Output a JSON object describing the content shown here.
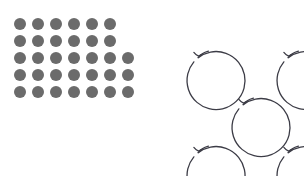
{
  "figure": {
    "background_color": "#ffffff",
    "width": 304,
    "height": 176
  },
  "dot_grid": {
    "label": "gray dot grid",
    "dot_color": "#6b6b6b",
    "dot_diameter": 12,
    "dot_gap": 6,
    "origin_x": 14,
    "origin_y": 18,
    "row_count": 5,
    "total_dots": 33,
    "rows": [
      {
        "index": 1,
        "count": 6
      },
      {
        "index": 2,
        "count": 6
      },
      {
        "index": 3,
        "count": 7
      },
      {
        "index": 4,
        "count": 7
      },
      {
        "index": 5,
        "count": 7
      }
    ]
  },
  "circle_arrows": {
    "label": "clockwise circular arrows",
    "stroke_color": "#3c3c46",
    "stroke_width": 1.3,
    "arrow_direction": "clockwise",
    "count": 5,
    "arrangement": "quincunx",
    "items": [
      {
        "name": "top-left",
        "cx": 176,
        "cy": 39,
        "r": 29
      },
      {
        "name": "top-right",
        "cx": 266,
        "cy": 39,
        "r": 29
      },
      {
        "name": "center",
        "cx": 221,
        "cy": 86,
        "r": 29
      },
      {
        "name": "bottom-left",
        "cx": 176,
        "cy": 134,
        "r": 29
      },
      {
        "name": "bottom-right",
        "cx": 266,
        "cy": 134,
        "r": 29
      }
    ]
  }
}
